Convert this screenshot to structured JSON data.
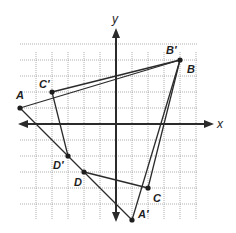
{
  "diagram": {
    "type": "coordinate-plane-quadrilaterals",
    "axes": {
      "x_label": "x",
      "y_label": "y",
      "x_range": [
        -6,
        5
      ],
      "y_range": [
        -6,
        5
      ],
      "grid": true,
      "unit_px": 16,
      "origin_px": [
        116,
        124
      ]
    },
    "points": [
      {
        "id": "A",
        "label": "A",
        "coord": [
          -6,
          1
        ],
        "label_offset": [
          -4,
          -9
        ]
      },
      {
        "id": "B",
        "label": "B",
        "coord": [
          4,
          4
        ],
        "label_offset": [
          7,
          13
        ]
      },
      {
        "id": "Bp",
        "label": "B′",
        "coord": [
          4,
          4
        ],
        "label_offset": [
          -14,
          -6
        ]
      },
      {
        "id": "Cp",
        "label": "C′",
        "coord": [
          -4,
          2
        ],
        "label_offset": [
          -13,
          -4
        ]
      },
      {
        "id": "Dp",
        "label": "D′",
        "coord": [
          -3,
          -2
        ],
        "label_offset": [
          -15,
          13
        ]
      },
      {
        "id": "D",
        "label": "D",
        "coord": [
          -2,
          -3
        ],
        "label_offset": [
          -10,
          14
        ]
      },
      {
        "id": "C",
        "label": "C",
        "coord": [
          2,
          -4
        ],
        "label_offset": [
          5,
          14
        ]
      },
      {
        "id": "Ap",
        "label": "A′",
        "coord": [
          1,
          -6
        ],
        "label_offset": [
          6,
          -2
        ]
      }
    ],
    "segments": [
      {
        "from": [
          -6,
          1
        ],
        "to": [
          4,
          4
        ],
        "name": "AB"
      },
      {
        "from": [
          -4,
          2
        ],
        "to": [
          4,
          4
        ],
        "name": "C'B'"
      },
      {
        "from": [
          -6,
          1
        ],
        "to": [
          1,
          -6
        ],
        "name": "A-A' diagonal (AD / D'A')"
      },
      {
        "from": [
          -4,
          2
        ],
        "to": [
          -3,
          -2
        ],
        "name": "C'D'"
      },
      {
        "from": [
          -2,
          -3
        ],
        "to": [
          2,
          -4
        ],
        "name": "DC"
      },
      {
        "from": [
          4,
          4
        ],
        "to": [
          2,
          -4
        ],
        "name": "BC"
      },
      {
        "from": [
          4,
          4
        ],
        "to": [
          1,
          -6
        ],
        "name": "B'A'"
      }
    ],
    "quadrilaterals": [
      {
        "name": "ABCD",
        "vertices": [
          "A",
          "B",
          "C",
          "D"
        ]
      },
      {
        "name": "A'B'C'D'",
        "vertices": [
          "A′",
          "B′",
          "C′",
          "D′"
        ]
      }
    ]
  }
}
